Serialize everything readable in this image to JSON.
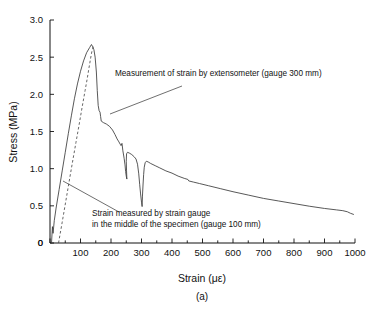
{
  "chart_data": {
    "type": "line",
    "title": "",
    "panel_label": "(a)",
    "xlabel": "Strain (με)",
    "ylabel": "Stress (MPa)",
    "xlim": [
      0,
      1000
    ],
    "ylim": [
      0,
      3.0
    ],
    "grid": false,
    "legend_position": "none",
    "xticks": [
      0,
      100,
      200,
      300,
      400,
      500,
      600,
      700,
      800,
      900,
      1000
    ],
    "xtick_labels": [
      "0",
      "100",
      "200",
      "300",
      "400",
      "500",
      "600",
      "700",
      "800",
      "900",
      "1000"
    ],
    "x_minor_tick_step": 50,
    "yticks": [
      0,
      0.5,
      1.0,
      1.5,
      2.0,
      2.5,
      3.0
    ],
    "ytick_labels": [
      "0",
      "0.5",
      "1.0",
      "1.5",
      "2.0",
      "2.5",
      "3.0"
    ],
    "series": [
      {
        "name": "Measurement of strain by extensometer (gauge 300 mm)",
        "style": "solid",
        "color": "#3a3a3a",
        "points": [
          [
            5,
            0.0
          ],
          [
            8,
            0.22
          ],
          [
            10,
            0.13
          ],
          [
            14,
            0.3
          ],
          [
            20,
            0.47
          ],
          [
            30,
            0.72
          ],
          [
            40,
            0.97
          ],
          [
            50,
            1.22
          ],
          [
            60,
            1.47
          ],
          [
            70,
            1.71
          ],
          [
            80,
            1.94
          ],
          [
            90,
            2.14
          ],
          [
            100,
            2.31
          ],
          [
            110,
            2.45
          ],
          [
            120,
            2.56
          ],
          [
            130,
            2.63
          ],
          [
            136,
            2.67
          ],
          [
            140,
            2.64
          ],
          [
            144,
            2.6
          ],
          [
            148,
            2.5
          ],
          [
            152,
            2.3
          ],
          [
            155,
            2.05
          ],
          [
            158,
            1.85
          ],
          [
            161,
            1.78
          ],
          [
            164,
            1.76
          ],
          [
            166,
            1.7
          ],
          [
            168,
            1.64
          ],
          [
            175,
            1.62
          ],
          [
            185,
            1.6
          ],
          [
            195,
            1.57
          ],
          [
            205,
            1.52
          ],
          [
            213,
            1.46
          ],
          [
            220,
            1.4
          ],
          [
            226,
            1.36
          ],
          [
            230,
            1.33
          ],
          [
            233,
            1.31
          ],
          [
            236,
            1.34
          ],
          [
            239,
            1.24
          ],
          [
            243,
            1.14
          ],
          [
            246,
            1.05
          ],
          [
            248,
            0.96
          ],
          [
            250,
            0.9
          ],
          [
            252,
            0.86
          ],
          [
            251,
            0.97
          ],
          [
            250,
            1.1
          ],
          [
            251,
            1.2
          ],
          [
            254,
            1.22
          ],
          [
            260,
            1.21
          ],
          [
            268,
            1.19
          ],
          [
            276,
            1.16
          ],
          [
            282,
            1.13
          ],
          [
            287,
            1.06
          ],
          [
            291,
            0.93
          ],
          [
            294,
            0.79
          ],
          [
            297,
            0.66
          ],
          [
            300,
            0.55
          ],
          [
            302,
            0.49
          ],
          [
            303,
            0.62
          ],
          [
            305,
            0.78
          ],
          [
            307,
            0.92
          ],
          [
            309,
            1.02
          ],
          [
            312,
            1.08
          ],
          [
            316,
            1.1
          ],
          [
            322,
            1.09
          ],
          [
            330,
            1.07
          ],
          [
            345,
            1.04
          ],
          [
            360,
            1.01
          ],
          [
            380,
            0.97
          ],
          [
            400,
            0.94
          ],
          [
            420,
            0.9
          ],
          [
            440,
            0.87
          ],
          [
            452,
            0.855
          ],
          [
            455,
            0.835
          ],
          [
            470,
            0.82
          ],
          [
            490,
            0.8
          ],
          [
            520,
            0.77
          ],
          [
            560,
            0.73
          ],
          [
            600,
            0.69
          ],
          [
            650,
            0.645
          ],
          [
            700,
            0.6
          ],
          [
            750,
            0.565
          ],
          [
            800,
            0.53
          ],
          [
            850,
            0.495
          ],
          [
            900,
            0.465
          ],
          [
            940,
            0.445
          ],
          [
            960,
            0.435
          ],
          [
            975,
            0.42
          ],
          [
            985,
            0.4
          ],
          [
            995,
            0.385
          ]
        ]
      },
      {
        "name": "Strain measured by strain gauge in the middle of the specimen (gauge 100 mm)",
        "style": "dashed",
        "color": "#4a4a4a",
        "points": [
          [
            28,
            0.0
          ],
          [
            40,
            0.28
          ],
          [
            55,
            0.64
          ],
          [
            70,
            1.0
          ],
          [
            85,
            1.35
          ],
          [
            95,
            1.58
          ],
          [
            105,
            1.82
          ],
          [
            115,
            2.05
          ],
          [
            122,
            2.21
          ],
          [
            128,
            2.36
          ],
          [
            133,
            2.48
          ],
          [
            137,
            2.57
          ],
          [
            140,
            2.62
          ],
          [
            143,
            2.655
          ]
        ]
      }
    ],
    "annotations": [
      {
        "id": "extensometer-annotation",
        "lines": [
          "Measurement of strain by extensometer (gauge 300 mm)"
        ],
        "text_x": 115,
        "text_y": 76,
        "leader": [
          [
            110,
            114
          ],
          [
            182,
            86
          ]
        ]
      },
      {
        "id": "strain-gauge-annotation",
        "lines": [
          "Strain measured by strain gauge",
          "in the middle of the specimen (gauge 100 mm)"
        ],
        "text_x": 92,
        "text_y": 216,
        "leader": [
          [
            63,
            181
          ],
          [
            119,
            212
          ]
        ]
      }
    ]
  },
  "figure": {
    "panel_label": "(a)",
    "xlabel": "Strain (με)",
    "ylabel": "Stress (MPa)",
    "background": "#ffffff",
    "axis_color": "#111111"
  }
}
